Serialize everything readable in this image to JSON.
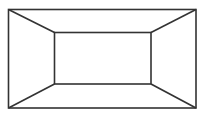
{
  "diagram": {
    "stroke_color": "#333333",
    "background": "#ffffff",
    "outer_rect": {
      "x1": 8,
      "y1": 9,
      "x2": 196,
      "y2": 108
    },
    "inner_rect": {
      "x1": 54,
      "y1": 32,
      "x2": 151,
      "y2": 84
    }
  }
}
